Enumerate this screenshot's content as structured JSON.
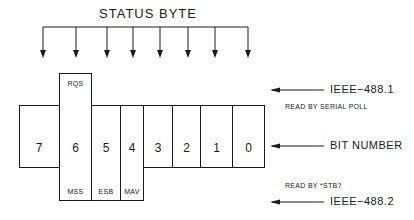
{
  "title": "STATUS BYTE",
  "bits": [
    {
      "number": "7",
      "top_label": "",
      "bottom_label": ""
    },
    {
      "number": "6",
      "top_label": "RQS",
      "bottom_label": "MSS"
    },
    {
      "number": "5",
      "top_label": "",
      "bottom_label": "ESB"
    },
    {
      "number": "4",
      "top_label": "",
      "bottom_label": "MAV"
    },
    {
      "number": "3",
      "top_label": "",
      "bottom_label": ""
    },
    {
      "number": "2",
      "top_label": "",
      "bottom_label": ""
    },
    {
      "number": "1",
      "top_label": "",
      "bottom_label": ""
    },
    {
      "number": "0",
      "top_label": "",
      "bottom_label": ""
    }
  ],
  "annotations": {
    "ieee1": {
      "label": "IEEE−488.1",
      "note": "READ BY SERIAL POLL"
    },
    "bit_number": {
      "label": "BIT NUMBER"
    },
    "ieee2": {
      "label": "IEEE−488.2",
      "note": "READ BY *STB?"
    }
  },
  "colors": {
    "line": "#1a1a1a",
    "background": "#ffffff"
  }
}
